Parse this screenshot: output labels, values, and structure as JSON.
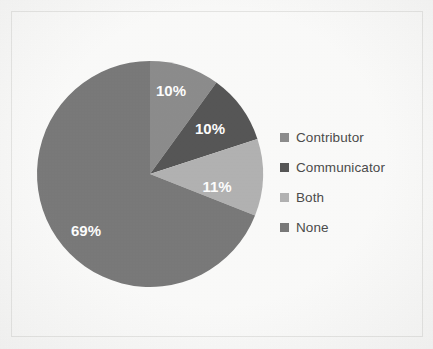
{
  "chart_data": {
    "type": "pie",
    "title": "",
    "categories": [
      "Contributor",
      "Communicator",
      "Both",
      "None"
    ],
    "values": [
      10,
      10,
      11,
      69
    ],
    "data_labels": [
      "10%",
      "10%",
      "11%",
      "69%"
    ],
    "colors": [
      "#8d8d8d",
      "#575757",
      "#b3b3b3",
      "#7a7a7a"
    ],
    "legend_position": "right",
    "grid": false,
    "units": "percent",
    "start_angle_deg": 0,
    "direction": "clockwise"
  },
  "legend": {
    "items": [
      {
        "label": "Contributor",
        "color": "#8d8d8d"
      },
      {
        "label": "Communicator",
        "color": "#575757"
      },
      {
        "label": "Both",
        "color": "#b3b3b3"
      },
      {
        "label": "None",
        "color": "#7a7a7a"
      }
    ]
  },
  "slices": [
    {
      "label": "10%",
      "x": 171,
      "y": 92
    },
    {
      "label": "10%",
      "x": 210,
      "y": 130
    },
    {
      "label": "11%",
      "x": 217,
      "y": 188
    },
    {
      "label": "69%",
      "x": 86,
      "y": 232
    }
  ]
}
